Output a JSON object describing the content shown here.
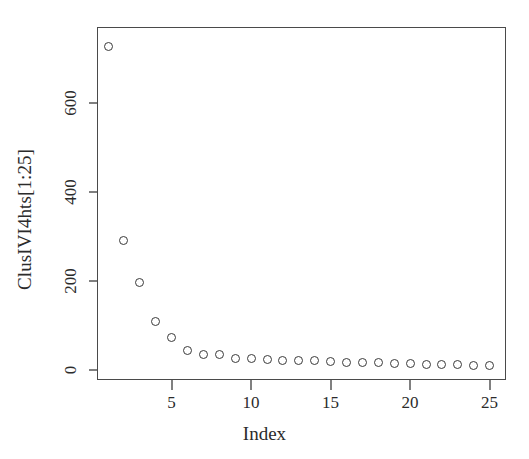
{
  "chart_data": {
    "type": "scatter",
    "title": "",
    "xlabel": "Index",
    "ylabel": "ClusIVI4hts[1:25]",
    "x": [
      1,
      2,
      3,
      4,
      5,
      6,
      7,
      8,
      9,
      10,
      11,
      12,
      13,
      14,
      15,
      16,
      17,
      18,
      19,
      20,
      21,
      22,
      23,
      24,
      25
    ],
    "values": [
      728,
      292,
      196,
      108,
      72,
      43,
      34,
      34,
      25,
      25,
      24,
      22,
      22,
      21,
      20,
      17,
      17,
      16,
      14,
      14,
      13,
      13,
      12,
      11,
      11
    ],
    "xticks": [
      5,
      10,
      15,
      20,
      25
    ],
    "xticklabels": [
      "5",
      "10",
      "15",
      "20",
      "25"
    ],
    "yticks": [
      0,
      200,
      400,
      600
    ],
    "yticklabels": [
      "0",
      "200",
      "400",
      "600"
    ],
    "xlim": [
      0.4,
      25.8
    ],
    "ylim": [
      -18,
      770
    ],
    "grid": false,
    "legend": null,
    "marker": "open-circle",
    "marker_color": "#3a3a3a",
    "background": "#ffffff",
    "axis_color": "#4a4a4a"
  },
  "figure": {
    "y_axis_label": "ClusIVI4hts[1:25]",
    "x_axis_label": "Index"
  }
}
